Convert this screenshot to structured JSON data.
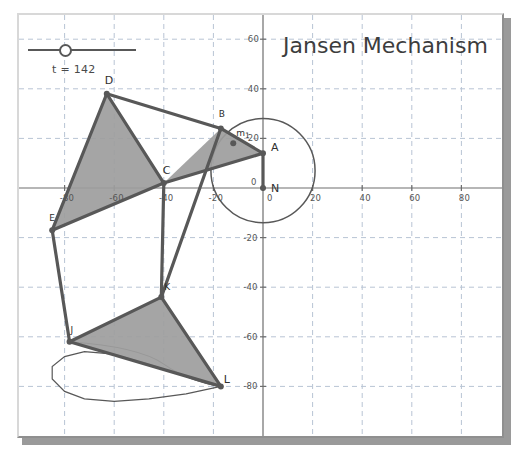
{
  "window": {
    "title": "Jansen Mechanism"
  },
  "header": {
    "title": "Jansen Mechanism"
  },
  "slider": {
    "name": "t",
    "label": "t = 142",
    "value": 142,
    "min": 0,
    "max": 360,
    "handle_fraction": 0.3
  },
  "colors": {
    "link": "#585858",
    "fill": "#9d9d9d",
    "axis": "#6e6e6e",
    "grid": "#b8c4d4",
    "text": "#3d3d3d",
    "frame_light": "#d8d8d8",
    "frame_dark": "#8f8f8f",
    "background": "#ffffff"
  },
  "chart_data": {
    "type": "scatter",
    "title": "Jansen Mechanism",
    "xlabel": "",
    "ylabel": "",
    "xlim": [
      -105,
      90
    ],
    "ylim": [
      -88,
      68
    ],
    "grid": true,
    "grid_step": 20,
    "legend": "none",
    "xticks": [
      -80,
      -60,
      -40,
      -20,
      0,
      20,
      40,
      60,
      80
    ],
    "xtick_labels": [
      "-80",
      "-60",
      "-40",
      "-20",
      "0",
      "20",
      "40",
      "60",
      "80"
    ],
    "yticks": [
      -80,
      -60,
      -40,
      -20,
      0,
      20,
      40,
      60
    ],
    "ytick_labels": [
      "-80",
      "-60",
      "-40",
      "-20",
      "0",
      "20",
      "40",
      "60"
    ],
    "origin_label": "0",
    "points": [
      {
        "id": "N",
        "label": "N",
        "x": 0,
        "y": 0,
        "label_dx": 8,
        "label_dy": 2
      },
      {
        "id": "A",
        "label": "A",
        "x": 0,
        "y": 14,
        "label_dx": 8,
        "label_dy": -4
      },
      {
        "id": "B",
        "label": "B",
        "x": -17,
        "y": 24,
        "label_dx": -2,
        "label_dy": -11
      },
      {
        "id": "m1",
        "label": "m1",
        "x": -12,
        "y": 18,
        "label_dx": 3,
        "label_dy": -7
      },
      {
        "id": "C",
        "label": "C",
        "x": -40,
        "y": 2,
        "label_dx": -1,
        "label_dy": -11
      },
      {
        "id": "D",
        "label": "D",
        "x": -63,
        "y": 38,
        "label_dx": -2,
        "label_dy": -12
      },
      {
        "id": "E",
        "label": "E",
        "x": -85,
        "y": -17,
        "label_dx": -3,
        "label_dy": -9
      },
      {
        "id": "K",
        "label": "K",
        "x": -41,
        "y": -44,
        "label_dx": 3,
        "label_dy": -7
      },
      {
        "id": "J",
        "label": "J",
        "x": -78,
        "y": -62,
        "label_dx": 1,
        "label_dy": -9
      },
      {
        "id": "L",
        "label": "L",
        "x": -17,
        "y": -80,
        "label_dx": 3,
        "label_dy": -5
      }
    ],
    "links": [
      {
        "from": "N",
        "to": "A"
      },
      {
        "from": "A",
        "to": "B"
      },
      {
        "from": "B",
        "to": "D"
      },
      {
        "from": "B",
        "to": "K"
      },
      {
        "from": "A",
        "to": "C"
      },
      {
        "from": "C",
        "to": "D"
      },
      {
        "from": "C",
        "to": "E"
      },
      {
        "from": "D",
        "to": "E"
      },
      {
        "from": "E",
        "to": "J"
      },
      {
        "from": "C",
        "to": "K"
      },
      {
        "from": "J",
        "to": "K"
      },
      {
        "from": "J",
        "to": "L"
      },
      {
        "from": "K",
        "to": "L"
      }
    ],
    "filled_triangles": [
      [
        "C",
        "D",
        "E"
      ],
      [
        "A",
        "C",
        "B"
      ],
      [
        "J",
        "K",
        "L"
      ]
    ],
    "crank_circle": {
      "cx": 0,
      "cy": 7,
      "r": 21
    },
    "foot_path_label": "foot trajectory",
    "annotations": [
      "t = 142"
    ]
  }
}
